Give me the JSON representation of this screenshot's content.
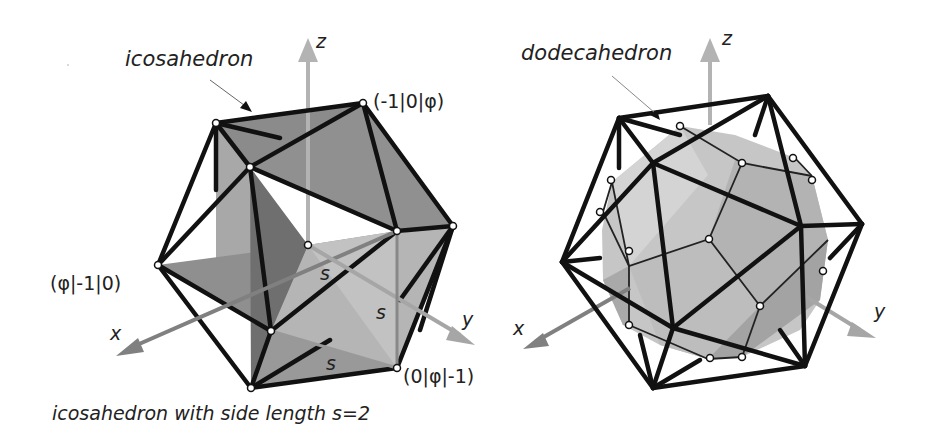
{
  "left_figure": {
    "title": "icosahedron",
    "caption": "icosahedron with side length s=2",
    "axes": {
      "x": "x",
      "y": "y",
      "z": "z"
    },
    "vertex_labels": {
      "top": "(-1|0|φ)",
      "left": "(φ|-1|0)",
      "bottom": "(0|φ|-1)"
    },
    "edge_labels": [
      "s",
      "s",
      "s"
    ]
  },
  "right_figure": {
    "title": "dodecahedron",
    "axes": {
      "x": "x",
      "y": "y",
      "z": "z"
    }
  },
  "colors": {
    "edge": "#111111",
    "plane_dark": "#8c8c8c",
    "plane_light": "#b8b8b8",
    "axis_x": "#808080",
    "axis_y": "#a6a6a6",
    "axis_z": "#b3b3b3",
    "solid_fill": "#c4c4c4"
  }
}
